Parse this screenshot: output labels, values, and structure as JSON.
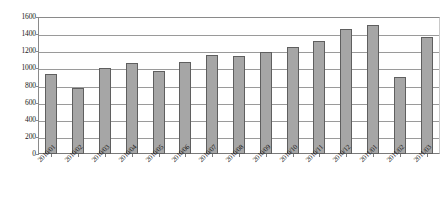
{
  "chart_data": {
    "type": "bar",
    "title": "",
    "xlabel": "",
    "ylabel": "",
    "ylim": [
      0,
      1600
    ],
    "ytick_step": 200,
    "yticks": [
      0,
      200,
      400,
      600,
      800,
      1000,
      1200,
      1400,
      1600
    ],
    "grid": true,
    "legend": "none",
    "bar_color": "#a6a6a6",
    "bar_border_color": "#5f5f5f",
    "gridline_color": "#9a9a9a",
    "axis_color": "#7a7a7a",
    "categories": [
      "2010/01",
      "2010/02",
      "2010/03",
      "2010/04",
      "2010/05",
      "2010/06",
      "2010/07",
      "2010/08",
      "2010/09",
      "2010/10",
      "2010/11",
      "2010/12",
      "2011/01",
      "2011/02",
      "2011/03"
    ],
    "values": [
      940,
      770,
      1010,
      1065,
      965,
      1075,
      1155,
      1140,
      1195,
      1250,
      1320,
      1455,
      1510,
      905,
      1370
    ]
  }
}
